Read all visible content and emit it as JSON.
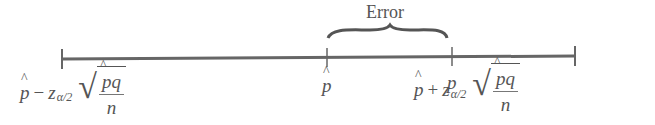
{
  "diagram": {
    "title": "Error",
    "axis": {
      "x_start": 62,
      "x_end": 575
    },
    "points": [
      {
        "id": "p_hat",
        "label": "p",
        "hat": true,
        "x": 327
      },
      {
        "id": "p",
        "label": "p",
        "hat": false,
        "x": 452
      }
    ],
    "left_endpoint": {
      "p": "p",
      "op": "−",
      "z": "z",
      "sub": "α/2",
      "num": "pq",
      "den": "n"
    },
    "right_endpoint": {
      "p": "p",
      "op": "+",
      "z": "z",
      "sub": "α/2",
      "num": "pq",
      "den": "n"
    },
    "colors": {
      "line": "#555555",
      "text": "#555555"
    }
  }
}
